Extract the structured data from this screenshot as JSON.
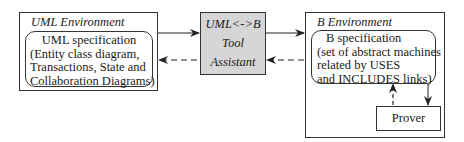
{
  "uml_environment": {
    "title": "UML Environment",
    "spec": {
      "lines": [
        "UML specification",
        "(Entity class diagram,",
        "Transactions, State and",
        "Collaboration Diagrams)"
      ]
    }
  },
  "tool": {
    "lines": [
      "UML<->B",
      "Tool",
      "Assistant"
    ],
    "fill_color": "#d6d6d6"
  },
  "b_environment": {
    "title": "B Environment",
    "spec": {
      "lines": [
        "B specification",
        "(set of abstract machines",
        "related by USES",
        "and INCLUDES links)"
      ]
    },
    "prover": {
      "label": "Prover"
    }
  },
  "arrows": [
    {
      "from": "UML specification",
      "to": "UML<->B Tool Assistant",
      "style": "solid"
    },
    {
      "from": "UML<->B Tool Assistant",
      "to": "UML specification",
      "style": "dashed"
    },
    {
      "from": "UML<->B Tool Assistant",
      "to": "B Environment",
      "style": "solid"
    },
    {
      "from": "B Environment",
      "to": "UML<->B Tool Assistant",
      "style": "dashed"
    },
    {
      "from": "B specification",
      "to": "Prover",
      "style": "solid"
    },
    {
      "from": "Prover",
      "to": "B specification",
      "style": "dashed"
    }
  ]
}
